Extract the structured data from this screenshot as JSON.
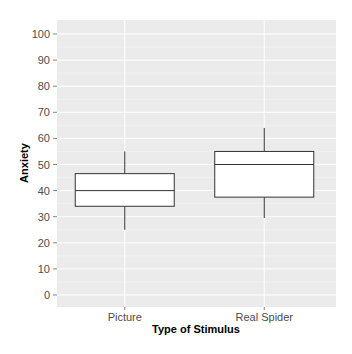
{
  "chart_data": {
    "type": "box",
    "title": "",
    "xlabel": "Type of Stimulus",
    "ylabel": "Anxiety",
    "categories": [
      "Picture",
      "Real Spider"
    ],
    "ylim": [
      -5,
      106
    ],
    "yticks": [
      0,
      10,
      20,
      30,
      40,
      50,
      60,
      70,
      80,
      90,
      100
    ],
    "grid": true,
    "legend": "none",
    "boxes": [
      {
        "category": "Picture",
        "whisker_low": 25,
        "q1": 34,
        "median": 40,
        "q3": 46.5,
        "whisker_high": 55
      },
      {
        "category": "Real Spider",
        "whisker_low": 29.5,
        "q1": 37.5,
        "median": 50,
        "q3": 55,
        "whisker_high": 64
      }
    ]
  },
  "colors": {
    "panel_bg": "#ebebeb",
    "grid": "#ffffff",
    "box_fill": "#ffffff",
    "box_line": "#333333"
  }
}
